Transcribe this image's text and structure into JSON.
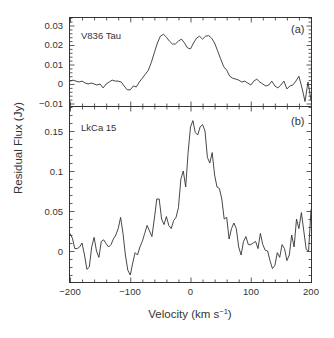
{
  "chart_data": [
    {
      "type": "line",
      "panel_tag": "(a)",
      "label": "V836 Tau",
      "xlabel": "Velocity (km s⁻¹)",
      "ylabel": "Residual Flux (Jy)",
      "xlim": [
        -200,
        200
      ],
      "ylim": [
        -0.0115,
        0.0345
      ],
      "yticks": [
        -0.01,
        0,
        0.01,
        0.02,
        0.03
      ],
      "ytick_labels": [
        "−0.01",
        "0",
        "0.01",
        "0.02",
        "0.03"
      ],
      "grid": false,
      "x": [
        -200,
        -195,
        -190,
        -185,
        -180,
        -175,
        -170,
        -165,
        -160,
        -155,
        -150,
        -145,
        -140,
        -135,
        -130,
        -125,
        -120,
        -115,
        -110,
        -105,
        -100,
        -95,
        -90,
        -85,
        -80,
        -75,
        -70,
        -65,
        -60,
        -55,
        -50,
        -45,
        -40,
        -35,
        -30,
        -25,
        -20,
        -15,
        -10,
        -5,
        0,
        5,
        10,
        15,
        20,
        25,
        30,
        35,
        40,
        45,
        50,
        55,
        60,
        65,
        70,
        75,
        80,
        85,
        90,
        95,
        100,
        105,
        110,
        115,
        120,
        125,
        130,
        135,
        140,
        145,
        150,
        155,
        160,
        165,
        170,
        175,
        180,
        185,
        190,
        195,
        200
      ],
      "values": [
        0.0015,
        0.002,
        0.0015,
        0.001,
        0.0015,
        0.0005,
        0.0,
        0.0005,
        0.0,
        -0.0005,
        0.0,
        -0.002,
        0.0,
        0.001,
        0.002,
        0.0015,
        0.0015,
        0.001,
        -0.001,
        -0.003,
        -0.003,
        -0.001,
        -0.0015,
        0.001,
        0.003,
        0.005,
        0.007,
        0.011,
        0.016,
        0.021,
        0.0245,
        0.0255,
        0.024,
        0.022,
        0.0205,
        0.0205,
        0.022,
        0.023,
        0.021,
        0.0185,
        0.018,
        0.021,
        0.0235,
        0.0245,
        0.023,
        0.0245,
        0.0248,
        0.0235,
        0.021,
        0.017,
        0.013,
        0.009,
        0.007,
        0.004,
        0.003,
        0.0025,
        0.002,
        0.001,
        0.0015,
        0.0005,
        -0.0005,
        0.0015,
        0.0025,
        0.001,
        0.0,
        -0.001,
        -0.0005,
        0.0015,
        -0.001,
        -0.002,
        -0.0005,
        0.0015,
        -0.0025,
        -0.001,
        -0.0005,
        0.0015,
        0.004,
        -0.002,
        -0.009,
        0.001,
        -0.0085
      ]
    },
    {
      "type": "line",
      "panel_tag": "(b)",
      "label": "LkCa 15",
      "xlabel": "Velocity (km s⁻¹)",
      "ylabel": "Residual Flux (Jy)",
      "xlim": [
        -200,
        200
      ],
      "xticks": [
        -200,
        -100,
        0,
        100,
        200
      ],
      "xtick_labels": [
        "−200",
        "−100",
        "0",
        "100",
        "200"
      ],
      "ylim": [
        -0.039,
        0.181
      ],
      "yticks": [
        0,
        0.05,
        0.1,
        0.15
      ],
      "ytick_labels": [
        "0",
        "0.05",
        "0.1",
        "0.15"
      ],
      "grid": false,
      "x": [
        -200,
        -196,
        -192,
        -188,
        -184,
        -180,
        -176,
        -172,
        -168,
        -164,
        -160,
        -156,
        -152,
        -148,
        -144,
        -140,
        -136,
        -132,
        -128,
        -124,
        -120,
        -116,
        -112,
        -108,
        -104,
        -100,
        -96,
        -92,
        -88,
        -84,
        -80,
        -76,
        -72,
        -68,
        -64,
        -60,
        -56,
        -52,
        -48,
        -44,
        -40,
        -36,
        -32,
        -28,
        -24,
        -20,
        -16,
        -12,
        -8,
        -4,
        0,
        4,
        8,
        12,
        16,
        20,
        24,
        28,
        32,
        36,
        40,
        44,
        48,
        52,
        56,
        60,
        64,
        68,
        72,
        76,
        80,
        84,
        88,
        92,
        96,
        100,
        104,
        108,
        112,
        116,
        120,
        124,
        128,
        132,
        136,
        140,
        144,
        148,
        152,
        156,
        160,
        164,
        168,
        172,
        176,
        180,
        184,
        188,
        192,
        196,
        200
      ],
      "values": [
        0.022,
        0.016,
        0.003,
        0.003,
        0.005,
        0.01,
        -0.005,
        -0.023,
        -0.02,
        0.005,
        0.017,
        0.0,
        -0.008,
        0.012,
        0.014,
        0.009,
        0.005,
        0.008,
        0.015,
        0.02,
        0.028,
        0.042,
        0.022,
        -0.005,
        -0.024,
        -0.03,
        -0.015,
        -0.002,
        -0.005,
        0.005,
        0.012,
        0.022,
        0.032,
        0.025,
        0.018,
        0.04,
        0.065,
        0.065,
        0.04,
        0.033,
        0.043,
        0.032,
        0.028,
        0.038,
        0.042,
        0.054,
        0.09,
        0.1,
        0.08,
        0.123,
        0.155,
        0.163,
        0.148,
        0.145,
        0.155,
        0.158,
        0.15,
        0.117,
        0.11,
        0.123,
        0.095,
        0.08,
        0.078,
        0.065,
        0.04,
        0.042,
        0.015,
        0.028,
        0.035,
        0.028,
        0.005,
        -0.005,
        0.012,
        0.018,
        0.008,
        0.008,
        0.01,
        0.012,
        0.003,
        0.022,
        0.008,
        0.001,
        0.0,
        -0.012,
        -0.022,
        -0.018,
        -0.002,
        -0.008,
        0.008,
        0.003,
        -0.012,
        -0.005,
        0.02,
        0.005,
        0.04,
        0.028,
        0.048,
        0.025,
        0.002,
        0.0,
        0.052
      ]
    }
  ],
  "figure": {
    "xlabel_main": "Velocity (km s",
    "xlabel_sup": "−1",
    "xlabel_close": ")",
    "ylabel": "Residual Flux (Jy)",
    "panel_a": {
      "tag": "(a)",
      "name": "V836 Tau"
    },
    "panel_b": {
      "tag": "(b)",
      "name": "LkCa 15"
    },
    "a_ytick_labels": [
      "0.03",
      "0.02",
      "0.01",
      "0",
      "−0.01"
    ],
    "b_ytick_labels": [
      "0.15",
      "0.1",
      "0.05",
      "0"
    ],
    "xtick_labels": [
      "−200",
      "−100",
      "0",
      "100",
      "200"
    ],
    "line_color": "#333333"
  }
}
